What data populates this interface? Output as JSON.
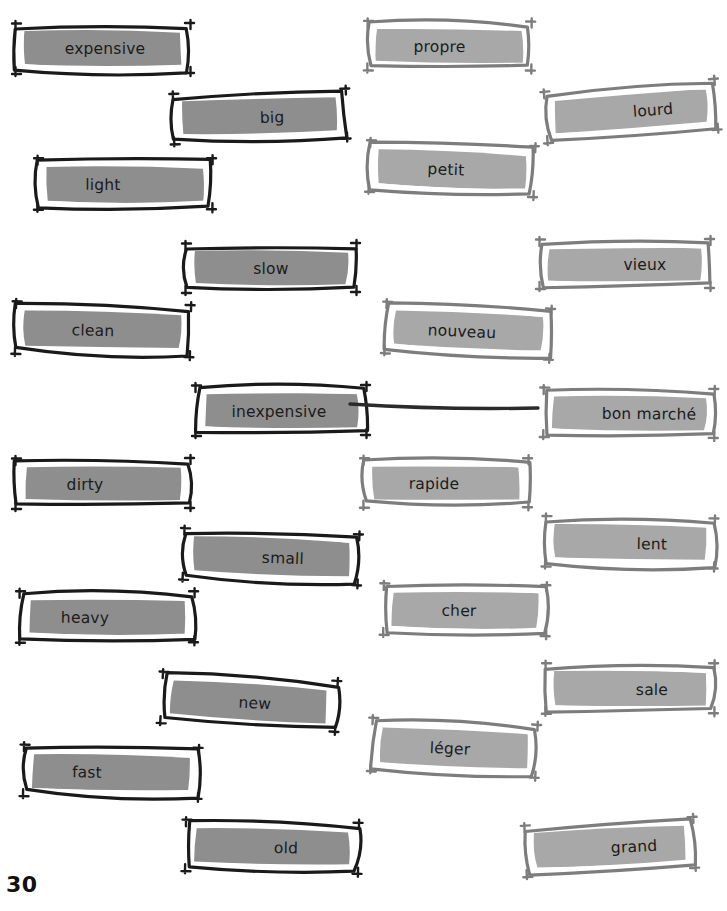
{
  "page": {
    "number": "30",
    "background_color": "#ffffff",
    "text_color": "#1b1b1b"
  },
  "styles": {
    "english_fill": "#8e8e8e",
    "english_border": "#1a1a1a",
    "english_inner_outline": "#ffffff",
    "french_fill": "#a8a8a8",
    "french_border": "#7d7d7d",
    "french_inner_outline": "#ffffff",
    "match_line_color": "#2b2b2b"
  },
  "columns": {
    "english": {
      "name": "english-words",
      "language": "English"
    },
    "french": {
      "name": "french-words",
      "language": "French"
    }
  },
  "english_cards": [
    {
      "id": "expensive",
      "label": "expensive",
      "x": 10,
      "y": 20,
      "w": 186,
      "h": 57,
      "rot": 0.0,
      "text_dx": 2,
      "text_dy": 0
    },
    {
      "id": "big",
      "label": "big",
      "x": 168,
      "y": 88,
      "w": 184,
      "h": 57,
      "rot": -1.6,
      "text_dx": 12,
      "text_dy": 1
    },
    {
      "id": "light",
      "label": "light",
      "x": 32,
      "y": 155,
      "w": 186,
      "h": 58,
      "rot": 0.2,
      "text_dx": -22,
      "text_dy": 1
    },
    {
      "id": "slow",
      "label": "slow",
      "x": 180,
      "y": 240,
      "w": 182,
      "h": 56,
      "rot": 0.0,
      "text_dx": 0,
      "text_dy": 1
    },
    {
      "id": "clean",
      "label": "clean",
      "x": 10,
      "y": 300,
      "w": 186,
      "h": 59,
      "rot": 1.4,
      "text_dx": -10,
      "text_dy": 1
    },
    {
      "id": "inexpensive",
      "label": "inexpensive",
      "x": 190,
      "y": 382,
      "w": 182,
      "h": 57,
      "rot": 0.0,
      "text_dx": -2,
      "text_dy": 1
    },
    {
      "id": "dirty",
      "label": "dirty",
      "x": 10,
      "y": 455,
      "w": 186,
      "h": 57,
      "rot": 0.0,
      "text_dx": -18,
      "text_dy": 1
    },
    {
      "id": "small",
      "label": "small",
      "x": 178,
      "y": 528,
      "w": 186,
      "h": 58,
      "rot": 2.2,
      "text_dx": 12,
      "text_dy": 1
    },
    {
      "id": "heavy",
      "label": "heavy",
      "x": 14,
      "y": 588,
      "w": 186,
      "h": 58,
      "rot": 0.2,
      "text_dx": -22,
      "text_dy": 1
    },
    {
      "id": "new",
      "label": "new",
      "x": 156,
      "y": 673,
      "w": 186,
      "h": 58,
      "rot": 3.2,
      "text_dx": 6,
      "text_dy": 1
    },
    {
      "id": "fast",
      "label": "fast",
      "x": 18,
      "y": 743,
      "w": 186,
      "h": 58,
      "rot": 1.2,
      "text_dx": -24,
      "text_dy": 1
    },
    {
      "id": "old",
      "label": "old",
      "x": 180,
      "y": 818,
      "w": 184,
      "h": 58,
      "rot": 1.2,
      "text_dx": 14,
      "text_dy": 1
    }
  ],
  "french_cards": [
    {
      "id": "propre",
      "label": "propre",
      "x": 362,
      "y": 18,
      "w": 175,
      "h": 56,
      "rot": 0.4,
      "text_dx": -10,
      "text_dy": 1
    },
    {
      "id": "lourd",
      "label": "lourd",
      "x": 540,
      "y": 82,
      "w": 182,
      "h": 58,
      "rot": -4.2,
      "text_dx": 22,
      "text_dy": 1
    },
    {
      "id": "petit",
      "label": "petit",
      "x": 364,
      "y": 140,
      "w": 176,
      "h": 58,
      "rot": 2.2,
      "text_dx": -6,
      "text_dy": 1
    },
    {
      "id": "vieux",
      "label": "vieux",
      "x": 534,
      "y": 236,
      "w": 182,
      "h": 56,
      "rot": 0.0,
      "text_dx": 20,
      "text_dy": 1
    },
    {
      "id": "nouveau",
      "label": "nouveau",
      "x": 380,
      "y": 302,
      "w": 176,
      "h": 58,
      "rot": 2.6,
      "text_dx": -6,
      "text_dy": 1
    },
    {
      "id": "bon marché",
      "label": "bon marché",
      "x": 538,
      "y": 385,
      "w": 182,
      "h": 56,
      "rot": 0.6,
      "text_dx": 20,
      "text_dy": 1
    },
    {
      "id": "rapide",
      "label": "rapide",
      "x": 358,
      "y": 455,
      "w": 176,
      "h": 56,
      "rot": 0.2,
      "text_dx": -12,
      "text_dy": 1
    },
    {
      "id": "lent",
      "label": "lent",
      "x": 540,
      "y": 514,
      "w": 180,
      "h": 57,
      "rot": 1.0,
      "text_dx": 22,
      "text_dy": 1
    },
    {
      "id": "cher",
      "label": "cher",
      "x": 378,
      "y": 581,
      "w": 174,
      "h": 58,
      "rot": 0.8,
      "text_dx": -6,
      "text_dy": 1
    },
    {
      "id": "sale",
      "label": "sale",
      "x": 540,
      "y": 660,
      "w": 180,
      "h": 57,
      "rot": 0.2,
      "text_dx": 22,
      "text_dy": 1
    },
    {
      "id": "léger",
      "label": "léger",
      "x": 366,
      "y": 718,
      "w": 176,
      "h": 60,
      "rot": 2.6,
      "text_dx": -4,
      "text_dy": 1
    },
    {
      "id": "grand",
      "label": "grand",
      "x": 520,
      "y": 818,
      "w": 180,
      "h": 58,
      "rot": -2.8,
      "text_dx": 24,
      "text_dy": 1
    }
  ],
  "match_lines": [
    {
      "id": "inexpensive-bon-marche",
      "from": "inexpensive",
      "to": "bon marché",
      "x1": 350,
      "y1": 404,
      "x2": 538,
      "y2": 408
    }
  ]
}
